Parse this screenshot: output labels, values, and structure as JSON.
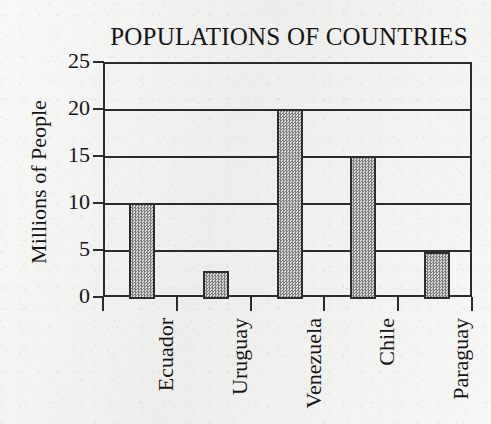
{
  "chart_data": {
    "type": "bar",
    "title": "POPULATIONS OF COUNTRIES",
    "xlabel": "",
    "ylabel": "Millions of People",
    "categories": [
      "Ecuador",
      "Uruguay",
      "Venezuela",
      "Chile",
      "Paraguay"
    ],
    "values": [
      10,
      2.8,
      20,
      15,
      4.8
    ],
    "ylim": [
      0,
      25
    ],
    "ytick_labels": [
      "0",
      "5",
      "10",
      "15",
      "20",
      "25"
    ],
    "ytick_values": [
      0,
      5,
      10,
      15,
      20,
      25
    ],
    "grid": "horizontal",
    "legend": "none",
    "series": [
      {
        "name": "Population",
        "values": [
          10,
          2.8,
          20,
          15,
          4.8
        ]
      }
    ],
    "bar_fill": "#9a9a9a",
    "bar_border_color": "#2d2d2d",
    "axis_color": "#2b2b2b",
    "background_color": "#f2f2f0"
  }
}
